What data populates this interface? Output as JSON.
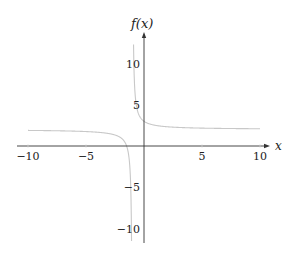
{
  "chart_data": {
    "type": "line",
    "title": "",
    "xlabel": "x",
    "ylabel": "f(x)",
    "function": "f(x) = 2 + 1/(x + 1)",
    "xlim": [
      -10,
      10
    ],
    "ylim": [
      -11.5,
      12.3
    ],
    "x_ticks": [
      -10,
      -5,
      5,
      10
    ],
    "x_tick_labels": [
      "−10",
      "−5",
      "5",
      "10"
    ],
    "y_ticks": [
      -10,
      -5,
      5,
      10
    ],
    "y_tick_labels": [
      "−10",
      "−5",
      "5",
      "10"
    ],
    "vertical_asymptote": -1,
    "horizontal_asymptote": 2,
    "grid": false,
    "legend": null,
    "series": [
      {
        "name": "f(x)",
        "color": "#c8c8c8",
        "x": [
          -10,
          -8,
          -6,
          -5,
          -4,
          -3,
          -2,
          -1.5,
          -1.25,
          -1.15,
          -1.1,
          -1.074,
          -0.903,
          -0.9,
          -0.85,
          -0.75,
          -0.5,
          0,
          1,
          2,
          3,
          4,
          5,
          6,
          8,
          10
        ],
        "values": [
          1.89,
          1.86,
          1.8,
          1.75,
          1.67,
          1.5,
          1.0,
          0.0,
          -2.0,
          -4.67,
          -8.0,
          -11.5,
          12.3,
          12.0,
          8.67,
          6.0,
          4.0,
          3.0,
          2.5,
          2.33,
          2.25,
          2.2,
          2.17,
          2.14,
          2.11,
          2.09
        ]
      }
    ]
  },
  "axes": {
    "x_label": "x",
    "y_label": "f(x)",
    "axis_color": "#333333",
    "curve_color": "#c8c8c8"
  }
}
